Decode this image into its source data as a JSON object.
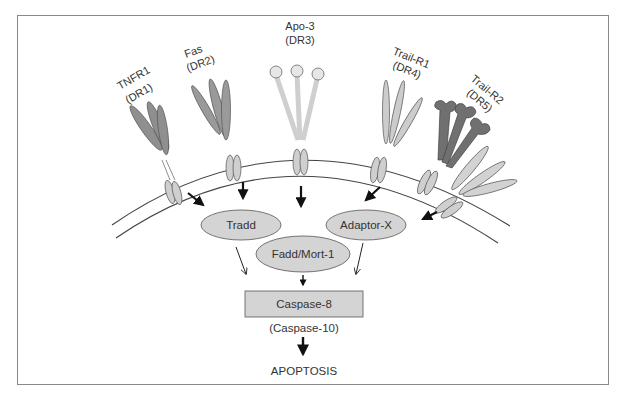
{
  "figure": {
    "receptors": [
      {
        "id": "tnfr1",
        "name": "TNFR1",
        "alt": "(DR1)",
        "color": "#8f8f8f"
      },
      {
        "id": "fas",
        "name": "Fas",
        "alt": "(DR2)",
        "color": "#9a9a9a"
      },
      {
        "id": "apo3",
        "name": "Apo-3",
        "alt": "(DR3)",
        "color": "#dcdcdc"
      },
      {
        "id": "trailr1",
        "name": "Trail-R1",
        "alt": "(DR4)",
        "color": "#c8c8c8"
      },
      {
        "id": "trailr2",
        "name": "Trail-R2",
        "alt": "(DR5)",
        "color": "#707070"
      }
    ],
    "adaptors": {
      "tradd": "Tradd",
      "fadd": "Fadd/Mort-1",
      "adaptor_x": "Adaptor-X"
    },
    "caspase": {
      "main": "Caspase-8",
      "alt": "(Caspase-10)"
    },
    "outcome": "APOPTOSIS",
    "colors": {
      "node_fill": "#d4d4d4",
      "node_stroke": "#555555",
      "membrane": "#444444",
      "arrow": "#111111"
    }
  }
}
